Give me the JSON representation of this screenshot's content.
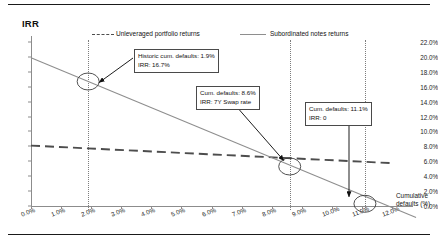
{
  "chart_data": {
    "type": "line",
    "title": "IRR",
    "xlabel": "Cumulative defaults (%)",
    "ylabel": "IRR",
    "xlim": [
      0,
      12
    ],
    "ylim": [
      0,
      22
    ],
    "xticks": [
      "0.0%",
      "1.0%",
      "2.0%",
      "3.0%",
      "4.0%",
      "5.0%",
      "6.0%",
      "7.0%",
      "8.0%",
      "9.0%",
      "10.0%",
      "11.0%",
      "12.0%"
    ],
    "yticks": [
      "0.0%",
      "2.0%",
      "4.0%",
      "6.0%",
      "8.0%",
      "10.0%",
      "12.0%",
      "14.0%",
      "16.0%",
      "18.0%",
      "20.0%",
      "22.0%"
    ],
    "grid": false,
    "legend_position": "top",
    "series": [
      {
        "name": "Unleveraged portfolio returns",
        "style": "dashed",
        "color": "#4d4d4d",
        "x": [
          0,
          12
        ],
        "values": [
          8.1,
          5.75
        ]
      },
      {
        "name": "Subordinated notes returns",
        "style": "solid",
        "color": "#8e8e8e",
        "x": [
          0,
          12.8
        ],
        "values": [
          19.9,
          -1.55
        ]
      }
    ],
    "markers": [
      {
        "name": "historic-default-point",
        "x": 1.9,
        "y": 16.7
      },
      {
        "name": "swap-rate-point",
        "x": 8.6,
        "y": 5.3
      },
      {
        "name": "zero-irr-point",
        "x": 11.1,
        "y": 0.3
      }
    ],
    "vertical_reference_lines": [
      1.9,
      8.6,
      11.1
    ],
    "annotations": [
      {
        "name": "historic-defaults-callout",
        "line1": "Historic cum. defaults: 1.9%",
        "line2": "IRR: 16.7%"
      },
      {
        "name": "swap-rate-callout",
        "line1": "Cum. defaults: 8.6%",
        "line2": "IRR: 7Y Swap rate"
      },
      {
        "name": "zero-irr-callout",
        "line1": "Cum. defaults: 11.1%",
        "line2": "IRR: 0"
      }
    ]
  },
  "axis_title": {
    "x_line1": "Cumulative",
    "x_line2": "defaults (%)"
  }
}
